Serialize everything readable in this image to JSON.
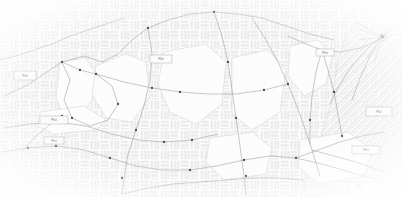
{
  "map": {
    "title": "Cadastral Survey Map",
    "canvas": {
      "width": 402,
      "height": 197
    },
    "background_color": "#ffffff",
    "texture": {
      "name": "basketweave-parquet",
      "tile_size": 10,
      "fill_color": "#ececec",
      "stroke_color": "#e2e2e2"
    },
    "hatch": {
      "name": "diagonal-hatch",
      "angle_degrees": 45,
      "spacing": 4,
      "stroke_color": "#d2d2d2"
    },
    "line_color": "#9a9a9a",
    "node_color": "#4a4a4a",
    "parcel_fill": "#fdfdfd",
    "parcel_stroke": "#c8c8c8",
    "label_box_fill": "#fbfbfb",
    "label_box_stroke": "#9e9e9e",
    "label_text_color": "#6e6e6e"
  },
  "labels": [
    {
      "id": "label-west-upper",
      "text": "Plot",
      "x": 14,
      "y": 71,
      "w": 22,
      "h": 9
    },
    {
      "id": "label-west-lower",
      "text": "Plot",
      "x": 40,
      "y": 116,
      "w": 28,
      "h": 8
    },
    {
      "id": "label-west-sub",
      "text": "Plot",
      "x": 44,
      "y": 137,
      "w": 20,
      "h": 7
    },
    {
      "id": "label-center",
      "text": "Plot",
      "x": 150,
      "y": 55,
      "w": 22,
      "h": 8
    },
    {
      "id": "label-north-east",
      "text": "Plot",
      "x": 316,
      "y": 49,
      "w": 18,
      "h": 7
    },
    {
      "id": "label-east",
      "text": "Plot",
      "x": 366,
      "y": 107,
      "w": 26,
      "h": 9
    },
    {
      "id": "label-se-upper",
      "text": "Plot",
      "x": 352,
      "y": 146,
      "w": 28,
      "h": 8
    },
    {
      "id": "label-se-lower",
      "text": "Plot",
      "x": 348,
      "y": 182,
      "w": 22,
      "h": 7
    }
  ],
  "parcels": [
    {
      "id": "parcel-west",
      "points": "60,62 86,58 96,74 92,100 78,120 62,116 56,96"
    },
    {
      "id": "parcel-west-strip",
      "points": "40,112 84,106 106,120 96,130 54,134 38,126"
    },
    {
      "id": "parcel-central",
      "points": "96,66 126,54 146,62 150,96 132,122 106,118 92,94"
    },
    {
      "id": "parcel-mid",
      "points": "164,52 206,44 226,62 222,104 196,124 170,112 158,84"
    },
    {
      "id": "parcel-east-mid",
      "points": "232,58 268,50 286,70 280,112 252,130 232,114"
    },
    {
      "id": "parcel-ne",
      "points": "290,46 318,40 332,56 326,84 304,96 288,76"
    },
    {
      "id": "parcel-south",
      "points": "210,138 252,132 272,148 266,174 224,180 206,162"
    },
    {
      "id": "parcel-se",
      "points": "300,140 348,132 372,150 364,176 318,184 298,166"
    }
  ],
  "hatch_regions": [
    {
      "id": "hatch-east",
      "points": "348,30 402,22 402,197 300,197 318,150 332,98 338,60"
    }
  ],
  "roads": [
    {
      "id": "road-nw-diagonal",
      "points": "4,96 26,86 44,74 62,62 84,56 102,62 118,54 132,40 148,28 168,20 190,14 214,12"
    },
    {
      "id": "road-west-loop",
      "points": "62,62 70,80 64,100 72,118 90,126 108,120 118,104 112,86 96,74 80,70 62,62"
    },
    {
      "id": "road-center-main",
      "points": "214,12 222,36 228,62 232,90 236,118 240,146 244,176 246,194"
    },
    {
      "id": "road-center-west",
      "points": "148,28 152,54 150,80 144,106 136,130 128,154 124,178 122,194"
    },
    {
      "id": "road-east-main",
      "points": "252,18 266,40 278,62 288,84 296,104 304,126 312,150 320,176"
    },
    {
      "id": "road-ne-branch",
      "points": "288,36 306,44 322,50 340,52 360,48 378,40 392,30"
    },
    {
      "id": "road-ne-spur",
      "points": "322,50 328,70 334,92 338,114 342,136"
    },
    {
      "id": "road-ne-spur2",
      "points": "322,50 316,72 312,96 310,120 310,144"
    },
    {
      "id": "road-east-fan-a",
      "points": "382,36 366,50 352,66 340,84 330,104"
    },
    {
      "id": "road-east-fan-b",
      "points": "382,36 370,56 360,78 352,100"
    },
    {
      "id": "road-south-main",
      "points": "2,152 28,148 56,146 84,150 110,158 136,166 162,170 190,170 216,166 244,160 270,156 296,158 322,164 350,172 378,180 400,186"
    },
    {
      "id": "road-south-upper",
      "points": "4,128 30,124 58,122 86,126 112,134 138,140 164,142 192,140 218,134"
    },
    {
      "id": "road-mid-cross",
      "points": "96,74 124,82 152,88 180,92 208,94 236,94 264,90 288,84"
    },
    {
      "id": "road-lower-cross",
      "points": "122,194 148,188 174,184 200,182 226,180 252,178 278,178 304,180"
    },
    {
      "id": "road-west-tail",
      "points": "62,116 48,126 34,138 22,152"
    },
    {
      "id": "road-nw-edge",
      "points": "0,60 16,56 34,50 52,44 70,36 88,30 106,24 124,18"
    },
    {
      "id": "road-ne-top",
      "points": "214,12 238,14 262,18 286,26 310,34 334,40"
    },
    {
      "id": "road-se-connect",
      "points": "296,158 318,150 340,142 362,136 384,132"
    },
    {
      "id": "road-se-lower",
      "points": "312,150 334,156 356,162 378,170 398,178"
    }
  ],
  "nodes": [
    {
      "id": "node-01",
      "x": 62,
      "y": 62
    },
    {
      "id": "node-02",
      "x": 96,
      "y": 74
    },
    {
      "id": "node-03",
      "x": 80,
      "y": 70
    },
    {
      "id": "node-04",
      "x": 72,
      "y": 118
    },
    {
      "id": "node-05",
      "x": 62,
      "y": 116
    },
    {
      "id": "node-06",
      "x": 118,
      "y": 104
    },
    {
      "id": "node-07",
      "x": 148,
      "y": 28
    },
    {
      "id": "node-08",
      "x": 214,
      "y": 12
    },
    {
      "id": "node-09",
      "x": 228,
      "y": 62
    },
    {
      "id": "node-10",
      "x": 236,
      "y": 118
    },
    {
      "id": "node-11",
      "x": 136,
      "y": 130
    },
    {
      "id": "node-12",
      "x": 152,
      "y": 88
    },
    {
      "id": "node-13",
      "x": 288,
      "y": 84
    },
    {
      "id": "node-14",
      "x": 322,
      "y": 50
    },
    {
      "id": "node-15",
      "x": 310,
      "y": 120
    },
    {
      "id": "node-16",
      "x": 342,
      "y": 136
    },
    {
      "id": "node-17",
      "x": 296,
      "y": 158
    },
    {
      "id": "node-18",
      "x": 244,
      "y": 160
    },
    {
      "id": "node-19",
      "x": 190,
      "y": 170
    },
    {
      "id": "node-20",
      "x": 110,
      "y": 158
    },
    {
      "id": "node-21",
      "x": 56,
      "y": 146
    },
    {
      "id": "node-22",
      "x": 28,
      "y": 148
    },
    {
      "id": "node-23",
      "x": 164,
      "y": 142
    },
    {
      "id": "node-24",
      "x": 192,
      "y": 140
    },
    {
      "id": "node-25",
      "x": 264,
      "y": 90
    },
    {
      "id": "node-26",
      "x": 180,
      "y": 92
    },
    {
      "id": "node-27",
      "x": 122,
      "y": 178
    },
    {
      "id": "node-28",
      "x": 246,
      "y": 176
    },
    {
      "id": "node-29",
      "x": 382,
      "y": 36
    },
    {
      "id": "node-30",
      "x": 334,
      "y": 92
    }
  ]
}
